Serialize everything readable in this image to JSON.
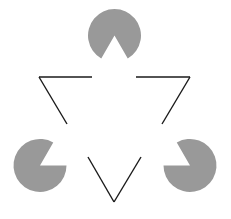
{
  "figure": {
    "type": "illusory-contour-figure",
    "canvas": {
      "width": 231,
      "height": 219,
      "background": "#ffffff"
    }
  },
  "colors": {
    "disc_fill": "#999999",
    "outline_stroke": "#1a1a1a",
    "background": "#ffffff"
  },
  "chart_data": {
    "type": "scatter",
    "xlabel": "",
    "ylabel": "",
    "xlim": [
      0,
      231
    ],
    "ylim": [
      0,
      219
    ],
    "grid": false,
    "legend": null,
    "discs": [
      {
        "name": "top-pacman",
        "cx": 114.5,
        "cy": 35.5,
        "r": 26.5,
        "wedge_start_deg": 60,
        "wedge_end_deg": 120,
        "notch_direction": "down",
        "fill": "#999999"
      },
      {
        "name": "bottom-left-pacman",
        "cx": 40,
        "cy": 165.5,
        "r": 26.5,
        "wedge_start_deg": 300,
        "wedge_end_deg": 360,
        "notch_direction": "up-right",
        "fill": "#999999"
      },
      {
        "name": "bottom-right-pacman",
        "cx": 190,
        "cy": 165.5,
        "r": 26.5,
        "wedge_start_deg": 180,
        "wedge_end_deg": 240,
        "notch_direction": "up-left",
        "fill": "#999999"
      }
    ],
    "outline_triangle": {
      "name": "inverted-outline-triangle",
      "orientation": "point-down",
      "vertices": [
        [
          39,
          77
        ],
        [
          190,
          77
        ],
        [
          114,
          202
        ]
      ],
      "stroke": "#1a1a1a",
      "stroke_width": 1.4,
      "segments": [
        {
          "name": "top-left-segment",
          "from": [
            39,
            77
          ],
          "to": [
            92,
            77
          ]
        },
        {
          "name": "top-right-segment",
          "from": [
            136,
            77
          ],
          "to": [
            190,
            77
          ]
        },
        {
          "name": "left-diagonal-segment",
          "from": [
            39,
            77
          ],
          "to": [
            67,
            124
          ]
        },
        {
          "name": "right-diagonal-segment",
          "from": [
            190,
            77
          ],
          "to": [
            162,
            124
          ]
        },
        {
          "name": "bottom-left-diagonal-segment",
          "from": [
            88,
            157
          ],
          "to": [
            114,
            202
          ]
        },
        {
          "name": "bottom-right-diagonal-segment",
          "from": [
            141,
            157
          ],
          "to": [
            114,
            202
          ]
        }
      ]
    },
    "illusory_triangle": {
      "name": "illusory-upright-triangle",
      "orientation": "point-up",
      "vertices": [
        [
          114.5,
          35.5
        ],
        [
          40,
          165.5
        ],
        [
          190,
          165.5
        ]
      ],
      "visible": false
    }
  }
}
